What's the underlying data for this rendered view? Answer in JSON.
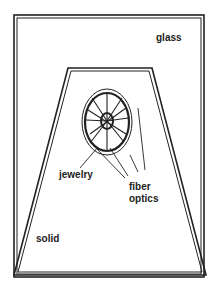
{
  "diagram": {
    "labels": {
      "outer": "glass",
      "inner": "solid",
      "center": "jewelry",
      "fiber_line1": "fiber",
      "fiber_line2": "optics"
    },
    "colors": {
      "ink": "#222222",
      "background": "#ffffff"
    }
  }
}
